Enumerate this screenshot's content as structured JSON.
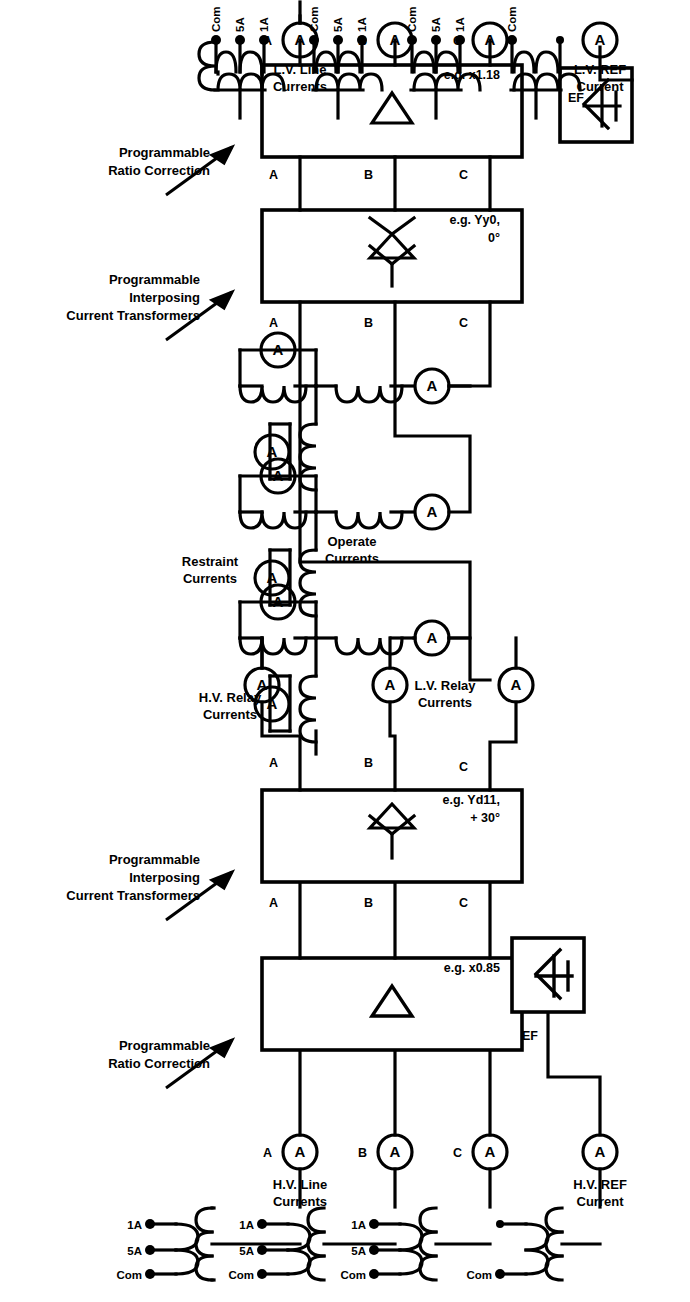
{
  "diagram": {
    "groups": {
      "hv_line_currents": "H.V. Line\nCurrents",
      "hv_line_currents_l1": "H.V. Line",
      "hv_line_currents_l2": "Currents",
      "hv_ref_current_l1": "H.V. REF",
      "hv_ref_current_l2": "Current",
      "lv_line_currents_l1": "L.V. Line",
      "lv_line_currents_l2": "Currents",
      "lv_ref_current_l1": "L.V. REF",
      "lv_ref_current_l2": "Current",
      "hv_relay_currents_l1": "H.V. Relay",
      "hv_relay_currents_l2": "Currents",
      "lv_relay_currents_l1": "L.V. Relay",
      "lv_relay_currents_l2": "Currents",
      "restraint_currents_l1": "Restraint",
      "restraint_currents_l2": "Currents",
      "operate_currents_l1": "Operate",
      "operate_currents_l2": "Currents"
    },
    "blocks": [
      {
        "id": "hv-ratio-correction",
        "callout_l1": "Programmable",
        "callout_l2": "Ratio Correction",
        "callout_l3": "",
        "example": "e.g. x0.85",
        "symbol": "delta"
      },
      {
        "id": "hv-interposing-ct",
        "callout_l1": "Programmable",
        "callout_l2": "Interposing",
        "callout_l3": "Current Transformers",
        "example_l1": "e.g. Yd11,",
        "example_l2": "+ 30°",
        "symbol": "star-delta"
      },
      {
        "id": "lv-interposing-ct",
        "callout_l1": "Programmable",
        "callout_l2": "Interposing",
        "callout_l3": "Current Transformers",
        "example_l1": "e.g. Yy0,",
        "example_l2": "0°",
        "symbol": "star-delta-star"
      },
      {
        "id": "lv-ratio-correction",
        "callout_l1": "Programmable",
        "callout_l2": "Ratio Correction",
        "callout_l3": "",
        "example": "e.g. x1.18",
        "symbol": "delta"
      }
    ],
    "phase_labels": [
      "A",
      "B",
      "C"
    ],
    "ef_label": "EF",
    "ct_terminals": [
      "Com",
      "5A",
      "1A"
    ],
    "ct_terminals_ref": [
      "Com"
    ],
    "ammeter_glyph": "A",
    "colors": {
      "line": "#000000",
      "background": "#ffffff"
    }
  }
}
